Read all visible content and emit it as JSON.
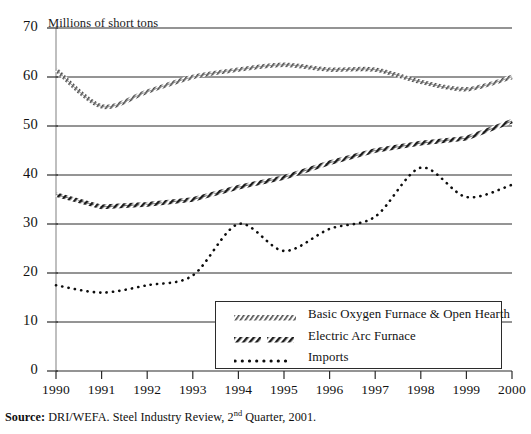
{
  "figure": {
    "axis_title": "Millions of short tons",
    "source_prefix": "Source:",
    "source_text_a": " DRI/WEFA. Steel Industry Review, 2",
    "source_sup": "nd",
    "source_text_b": " Quarter, 2001."
  },
  "legend": {
    "items": [
      {
        "label": "Basic Oxygen Furnace & Open Hearth",
        "style": "hatched-line"
      },
      {
        "label": "Electric Arc Furnace",
        "style": "dashed-thick"
      },
      {
        "label": "Imports",
        "style": "dotted"
      }
    ]
  },
  "chart_data": {
    "type": "line",
    "title": "Millions of short tons",
    "xlabel": "",
    "ylabel": "Millions of short tons",
    "xlim": [
      1990,
      2000
    ],
    "ylim": [
      0,
      70
    ],
    "yticks": [
      0,
      10,
      20,
      30,
      40,
      50,
      60,
      70
    ],
    "xticks": [
      1990,
      1991,
      1992,
      1993,
      1994,
      1995,
      1996,
      1997,
      1998,
      1999,
      2000
    ],
    "grid": true,
    "legend_position": "inside-bottom-right",
    "categories": [
      1990,
      1991,
      1992,
      1993,
      1994,
      1995,
      1996,
      1997,
      1998,
      1999,
      2000
    ],
    "series": [
      {
        "name": "Basic Oxygen Furnace & Open Hearth",
        "values": [
          61.5,
          54.0,
          57.0,
          60.0,
          61.5,
          62.5,
          61.5,
          61.5,
          59.0,
          57.5,
          60.0
        ]
      },
      {
        "name": "Electric Arc Furnace",
        "values": [
          36.0,
          33.5,
          34.0,
          35.0,
          37.5,
          39.5,
          42.5,
          45.0,
          46.5,
          47.5,
          51.0
        ]
      },
      {
        "name": "Imports",
        "values": [
          17.5,
          16.0,
          17.5,
          19.5,
          30.0,
          24.5,
          29.0,
          31.5,
          41.5,
          35.5,
          38.0
        ]
      }
    ]
  }
}
